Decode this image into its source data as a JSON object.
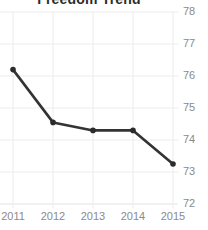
{
  "chart_data": {
    "type": "line",
    "title": "Freedom Trend",
    "xlabel": "",
    "ylabel": "",
    "categories": [
      "2011",
      "2012",
      "2013",
      "2014",
      "2015"
    ],
    "x": [
      2011,
      2012,
      2013,
      2014,
      2015
    ],
    "values": [
      76.2,
      74.55,
      74.3,
      74.3,
      73.25
    ],
    "series": [
      {
        "name": "Freedom Trend",
        "values": [
          76.2,
          74.55,
          74.3,
          74.3,
          73.25
        ]
      }
    ],
    "ylim": [
      72,
      78
    ],
    "yticks": [
      72,
      73,
      74,
      75,
      76,
      77,
      78
    ],
    "ytick_labels": [
      "72",
      "73",
      "74",
      "75",
      "76",
      "77",
      "78"
    ],
    "xtick_labels": [
      "2011",
      "2012",
      "2013",
      "2014",
      "2015"
    ],
    "grid": true,
    "grid_color": "#ececec",
    "legend": false,
    "legend_position": "none",
    "y_axis_side": "right",
    "line_color": "#333333",
    "marker_color": "#2b2b2b",
    "marker": "circle",
    "tick_label_color": "#8a8a8a",
    "title_color": "#2b2b2b",
    "background_color": "#ffffff"
  }
}
